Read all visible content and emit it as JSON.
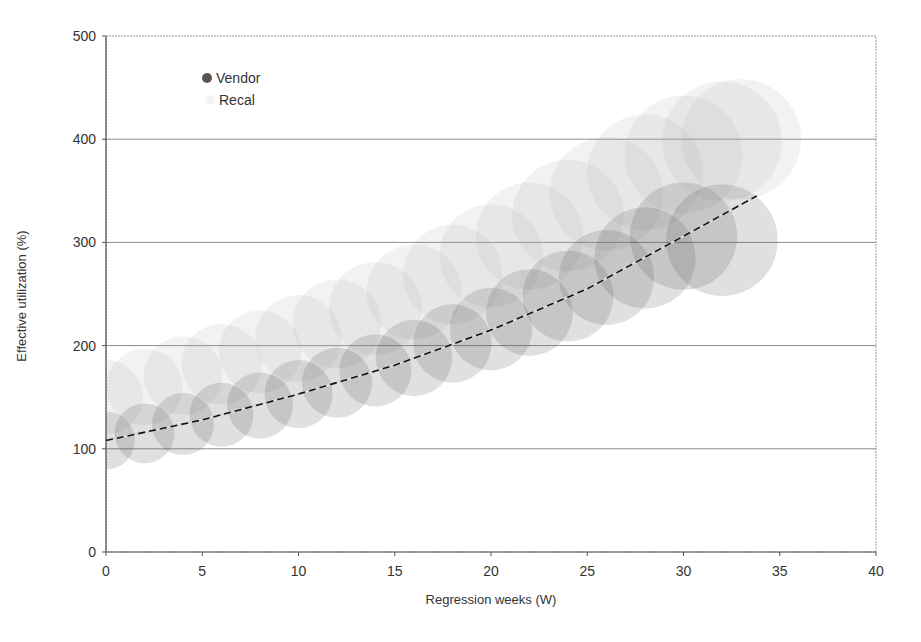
{
  "chart_data": {
    "type": "scatter",
    "subtype": "bubble",
    "title": "",
    "xlabel": "Regression weeks (W)",
    "ylabel": "Effective utilization (%)",
    "xlim": [
      0,
      40
    ],
    "ylim": [
      0,
      500
    ],
    "xticks": [
      0,
      5,
      10,
      15,
      20,
      25,
      30,
      35,
      40
    ],
    "yticks": [
      0,
      100,
      200,
      300,
      400,
      500
    ],
    "grid": {
      "horizontal": true,
      "vertical": false
    },
    "legend": {
      "position": "upper-left-inside",
      "entries": [
        "Vendor",
        "Recal"
      ]
    },
    "series": [
      {
        "name": "Vendor",
        "color": "#555555",
        "opacity": 0.18,
        "x": [
          0,
          2,
          4,
          6,
          8,
          10,
          12,
          14,
          16,
          18,
          20,
          22,
          24,
          26,
          28,
          30,
          32
        ],
        "y": [
          108,
          115,
          124,
          133,
          142,
          153,
          164,
          176,
          188,
          202,
          216,
          232,
          248,
          266,
          285,
          306,
          302
        ],
        "radius_units": [
          28,
          29,
          30,
          31,
          32,
          33,
          34,
          35,
          37,
          38,
          40,
          42,
          44,
          46,
          49,
          52,
          54
        ]
      },
      {
        "name": "Recal",
        "color": "#b0b0b0",
        "opacity": 0.16,
        "x": [
          0,
          2,
          4,
          6,
          8,
          10,
          12,
          14,
          16,
          18,
          20,
          22,
          24,
          26,
          28,
          30,
          32,
          33
        ],
        "y": [
          150,
          160,
          171,
          182,
          194,
          207,
          221,
          236,
          252,
          269,
          287,
          306,
          326,
          347,
          368,
          385,
          398,
          400
        ],
        "radius_units": [
          36,
          37,
          38,
          39,
          40,
          42,
          43,
          45,
          46,
          48,
          50,
          52,
          54,
          55,
          56,
          57,
          58,
          58
        ]
      }
    ],
    "trendline": {
      "series": "Vendor",
      "style": "dashed",
      "type": "exponential",
      "x": [
        0,
        5,
        10,
        15,
        20,
        25,
        30,
        33.8
      ],
      "y": [
        108,
        128,
        153,
        181,
        215,
        255,
        306,
        345
      ]
    }
  },
  "labels": {
    "xlabel": "Regression weeks (W)",
    "ylabel": "Effective utilization (%)",
    "legend_vendor": "Vendor",
    "legend_recal": "Recal"
  }
}
